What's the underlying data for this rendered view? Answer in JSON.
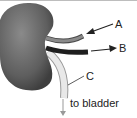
{
  "diagram": {
    "labels": {
      "a": "A",
      "b": "B",
      "c": "C",
      "bladder": "to bladder"
    },
    "colors": {
      "kidney": "#6e6e6e",
      "vessel_a": "#7a7a7a",
      "vessel_b": "#1e1e1e",
      "ureter": "#e6e6e6"
    }
  }
}
